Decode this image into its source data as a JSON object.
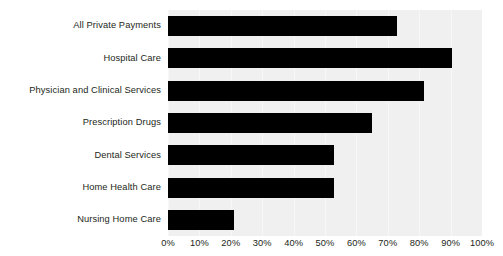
{
  "chart_data": {
    "type": "bar",
    "orientation": "horizontal",
    "title": "",
    "subtitle": "",
    "xlabel": "",
    "ylabel": "",
    "xlim": [
      0,
      100
    ],
    "ylim": null,
    "grid": true,
    "legend": null,
    "legend_position": "none",
    "bar_color": "#000000",
    "plot_background": "#f0f0f0",
    "gridline_color": "#f7f7f7",
    "text_color": "#231f20",
    "categories": [
      "All Private Payments",
      "Hospital Care",
      "Physician and Clinical Services",
      "Prescription Drugs",
      "Dental Services",
      "Home Health Care",
      "Nursing Home Care"
    ],
    "values": [
      73,
      90.5,
      81.5,
      65,
      53,
      53,
      21
    ],
    "value_unit": "%",
    "xticks": [
      0,
      10,
      20,
      30,
      40,
      50,
      60,
      70,
      80,
      90,
      100
    ],
    "xtick_labels": [
      "0%",
      "10%",
      "20%",
      "30%",
      "40%",
      "50%",
      "60%",
      "70%",
      "80%",
      "90%",
      "100%"
    ]
  }
}
